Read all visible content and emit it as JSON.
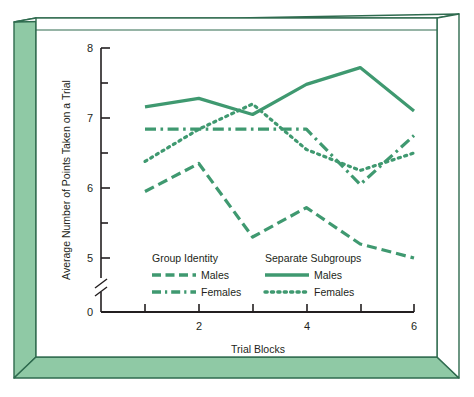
{
  "chart_data": {
    "type": "line",
    "title": "",
    "xlabel": "Trial Blocks",
    "ylabel": "Average Number of Points Taken on a Trial",
    "x": [
      1,
      2,
      3,
      4,
      5,
      6
    ],
    "xtick_values": [
      1,
      2,
      3,
      4,
      5,
      6
    ],
    "xtick_labels": [
      "",
      "2",
      "",
      "4",
      "",
      "6"
    ],
    "ytick_values": [
      0,
      5,
      5.5,
      6,
      6.5,
      7,
      7.5,
      8
    ],
    "ytick_labels": [
      "0",
      "5",
      "",
      "6",
      "",
      "7",
      "",
      "8"
    ],
    "ylim": [
      4.75,
      8
    ],
    "y_axis_break": true,
    "y_axis_break_label": "0",
    "grid": false,
    "legend_position": "inside-lower-left",
    "line_color": "#3f9970",
    "series": [
      {
        "name": "Males",
        "group": "Group Identity",
        "style": "dashed",
        "values": [
          5.95,
          6.35,
          5.3,
          5.72,
          5.2,
          5.0
        ]
      },
      {
        "name": "Females",
        "group": "Group Identity",
        "style": "dash-dot",
        "values": [
          6.84,
          6.84,
          6.84,
          6.84,
          6.05,
          6.75
        ]
      },
      {
        "name": "Males",
        "group": "Separate Subgroups",
        "style": "solid",
        "values": [
          7.16,
          7.28,
          7.05,
          7.48,
          7.72,
          7.1
        ]
      },
      {
        "name": "Females",
        "group": "Separate Subgroups",
        "style": "dotted",
        "values": [
          6.38,
          6.84,
          7.2,
          6.55,
          6.25,
          6.5
        ]
      }
    ]
  },
  "legend": {
    "group_a": {
      "heading": "Group Identity",
      "items": [
        {
          "label": "Males",
          "style": "dashed"
        },
        {
          "label": "Females",
          "style": "dash-dot"
        }
      ]
    },
    "group_b": {
      "heading": "Separate Subgroups",
      "items": [
        {
          "label": "Males",
          "style": "solid"
        },
        {
          "label": "Females",
          "style": "dotted"
        }
      ]
    }
  },
  "axes": {
    "x_title": "Trial Blocks",
    "y_title": "Average Number of Points Taken on a Trial",
    "x_tick_labels": [
      "2",
      "4",
      "6"
    ],
    "y_tick_labels": [
      "8",
      "7",
      "6",
      "5",
      "0"
    ]
  },
  "frame": {
    "panel_color": "#8fc9a5",
    "panel_edge_color": "#2f6b4f",
    "plot_background": "#ffffff",
    "axis_color": "#231f20"
  }
}
